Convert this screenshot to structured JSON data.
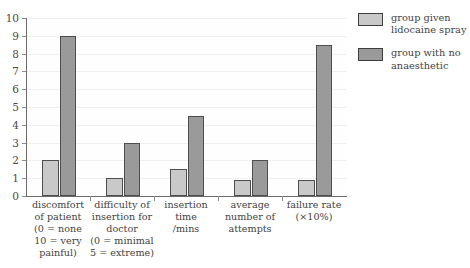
{
  "chart_data": {
    "type": "bar",
    "title": "",
    "xlabel": "",
    "ylabel": "",
    "ylim": [
      0,
      10
    ],
    "ytick_labels": [
      "0",
      "1",
      "2",
      "3",
      "4",
      "5",
      "6",
      "7",
      "8",
      "9",
      "10"
    ],
    "grid": true,
    "legend_position": "right",
    "categories": [
      "discomfort of patient (0 = none 10 = very painful)",
      "difficulty of insertion for doctor (0 = minimal 5 = extreme)",
      "insertion time /mins",
      "average number of attempts",
      "failure rate (×10%)"
    ],
    "category_label_lines": [
      [
        "discomfort",
        "of patient",
        "(0 = none",
        "10 = very",
        "painful)"
      ],
      [
        "difficulty of",
        "insertion for",
        "doctor",
        "(0 = minimal",
        "5 = extreme)"
      ],
      [
        "insertion",
        "time",
        "/mins"
      ],
      [
        "average",
        "number of",
        "attempts"
      ],
      [
        "failure rate",
        "(×10%)"
      ]
    ],
    "series": [
      {
        "name": "group given lidocaine spray",
        "name_lines": [
          "group given",
          "lidocaine spray"
        ],
        "color": "#c9c9c9",
        "values": [
          2,
          1,
          1.5,
          0.9,
          0.9
        ]
      },
      {
        "name": "group with no anaesthetic",
        "name_lines": [
          "group with no",
          "anaesthetic"
        ],
        "color": "#9a9a9a",
        "values": [
          9,
          3,
          4.5,
          2,
          8.5
        ]
      }
    ]
  }
}
